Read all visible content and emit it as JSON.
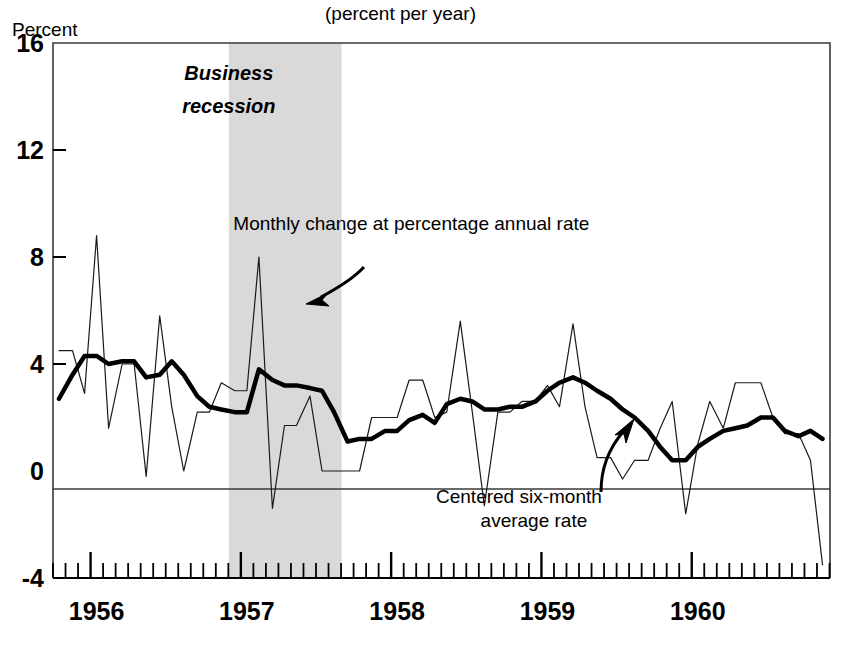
{
  "chart_data": {
    "type": "line",
    "title": "(percent per year)",
    "xlabel": "",
    "ylabel": "Percent",
    "ylim": [
      -4,
      16
    ],
    "xlim": [
      1955.75,
      1960.92
    ],
    "yticks": [
      "16",
      "12",
      "8",
      "4",
      "0",
      "-4"
    ],
    "ytick_values": [
      16,
      12,
      8,
      4,
      0,
      -4
    ],
    "xticks": [
      "1956",
      "1957",
      "1958",
      "1959",
      "1960"
    ],
    "xtick_values": [
      1956,
      1957,
      1958,
      1959,
      1960
    ],
    "grid": false,
    "legend_position": "inline-annotations",
    "annotations": [
      {
        "name": "monthly-change-label",
        "text": "Monthly change at percentage annual rate",
        "x": 1956.95,
        "y": 9.0
      },
      {
        "name": "centered-average-label-line1",
        "text": "Centered six-month",
        "x": 1958.85,
        "y": -1.2
      },
      {
        "name": "centered-average-label-line2",
        "text": "average rate",
        "x": 1958.95,
        "y": -2.1
      },
      {
        "name": "business-recession-label-line1",
        "text": "Business",
        "x": 1956.92,
        "y": 14.6
      },
      {
        "name": "business-recession-label-line2",
        "text": "recession",
        "x": 1956.92,
        "y": 13.4
      }
    ],
    "shaded_regions": [
      {
        "name": "business-recession",
        "label": "Business recession",
        "x_start": 1956.92,
        "x_end": 1957.67,
        "color": "#d9d9d9"
      }
    ],
    "series": [
      {
        "name": "Monthly change at percentage annual rate",
        "style": "thin",
        "color": "#1a1a1a",
        "linewidth": 1.2,
        "x": [
          1955.79,
          1955.88,
          1955.96,
          1956.04,
          1956.12,
          1956.21,
          1956.29,
          1956.37,
          1956.46,
          1956.54,
          1956.62,
          1956.71,
          1956.79,
          1956.87,
          1956.96,
          1957.04,
          1957.12,
          1957.21,
          1957.29,
          1957.37,
          1957.46,
          1957.54,
          1957.62,
          1957.71,
          1957.79,
          1957.87,
          1957.96,
          1958.04,
          1958.12,
          1958.21,
          1958.29,
          1958.37,
          1958.46,
          1958.54,
          1958.62,
          1958.71,
          1958.79,
          1958.87,
          1958.96,
          1959.04,
          1959.12,
          1959.21,
          1959.29,
          1959.37,
          1959.46,
          1959.54,
          1959.62,
          1959.71,
          1959.79,
          1959.87,
          1959.96,
          1960.04,
          1960.12,
          1960.21,
          1960.29,
          1960.37,
          1960.46,
          1960.54,
          1960.62,
          1960.71,
          1960.79,
          1960.87
        ],
        "values": [
          4.5,
          4.5,
          2.9,
          8.8,
          1.6,
          4.0,
          4.0,
          -0.2,
          5.8,
          2.4,
          0.0,
          2.2,
          2.2,
          3.3,
          3.0,
          3.0,
          8.0,
          -1.4,
          1.7,
          1.7,
          2.8,
          0.0,
          0.0,
          0.0,
          0.0,
          2.0,
          2.0,
          2.0,
          3.4,
          3.4,
          2.0,
          2.2,
          5.6,
          2.2,
          -1.3,
          2.2,
          2.2,
          2.6,
          2.6,
          3.2,
          2.4,
          5.5,
          2.4,
          0.5,
          0.5,
          -0.3,
          0.4,
          0.4,
          1.6,
          2.6,
          -1.6,
          1.0,
          2.6,
          1.6,
          3.3,
          3.3,
          3.3,
          2.0,
          1.4,
          1.4,
          0.4,
          -3.5
        ]
      },
      {
        "name": "Centered six-month average rate",
        "style": "thick",
        "color": "#000000",
        "linewidth": 4.5,
        "x": [
          1955.79,
          1955.88,
          1955.96,
          1956.04,
          1956.12,
          1956.21,
          1956.29,
          1956.37,
          1956.46,
          1956.54,
          1956.62,
          1956.71,
          1956.79,
          1956.87,
          1956.96,
          1957.04,
          1957.12,
          1957.21,
          1957.29,
          1957.37,
          1957.46,
          1957.54,
          1957.62,
          1957.71,
          1957.79,
          1957.87,
          1957.96,
          1958.04,
          1958.12,
          1958.21,
          1958.29,
          1958.37,
          1958.46,
          1958.54,
          1958.62,
          1958.71,
          1958.79,
          1958.87,
          1958.96,
          1959.04,
          1959.12,
          1959.21,
          1959.29,
          1959.37,
          1959.46,
          1959.54,
          1959.62,
          1959.71,
          1959.79,
          1959.87,
          1959.96,
          1960.04,
          1960.12,
          1960.21,
          1960.29,
          1960.37,
          1960.46,
          1960.54,
          1960.62,
          1960.71,
          1960.79,
          1960.87
        ],
        "values": [
          2.7,
          3.6,
          4.3,
          4.3,
          4.0,
          4.1,
          4.1,
          3.5,
          3.6,
          4.1,
          3.6,
          2.8,
          2.4,
          2.3,
          2.2,
          2.2,
          3.8,
          3.4,
          3.2,
          3.2,
          3.1,
          3.0,
          2.2,
          1.1,
          1.2,
          1.2,
          1.5,
          1.5,
          1.9,
          2.1,
          1.8,
          2.5,
          2.7,
          2.6,
          2.3,
          2.3,
          2.4,
          2.4,
          2.6,
          3.0,
          3.3,
          3.5,
          3.3,
          3.0,
          2.7,
          2.3,
          2.0,
          1.5,
          0.9,
          0.4,
          0.4,
          0.9,
          1.2,
          1.5,
          1.6,
          1.7,
          2.0,
          2.0,
          1.5,
          1.3,
          1.5,
          1.2
        ]
      }
    ]
  },
  "axes": {
    "y_axis_title": "Percent",
    "chart_title": "(percent per year)"
  },
  "colors": {
    "recession_band": "#d9d9d9",
    "line_thin": "#1a1a1a",
    "line_thick": "#000000",
    "axis": "#000000",
    "background": "#ffffff"
  }
}
